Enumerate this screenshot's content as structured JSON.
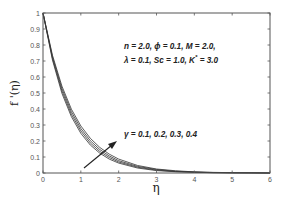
{
  "chart_data": {
    "type": "line",
    "title": "",
    "xlabel": "η",
    "ylabel": "f '(η)",
    "xlim": [
      0,
      6
    ],
    "ylim": [
      0,
      1
    ],
    "xticks": [
      0,
      1,
      2,
      3,
      4,
      5,
      6
    ],
    "yticks": [
      0,
      0.1,
      0.2,
      0.3,
      0.4,
      0.5,
      0.6,
      0.7,
      0.8,
      0.9,
      1
    ],
    "grid": false,
    "x": [
      0,
      0.25,
      0.5,
      0.75,
      1,
      1.25,
      1.5,
      1.75,
      2,
      2.5,
      3,
      3.5,
      4,
      4.5,
      5,
      5.5,
      6
    ],
    "series": [
      {
        "name": "γ = 0.1",
        "values": [
          1,
          0.706,
          0.498,
          0.352,
          0.248,
          0.175,
          0.124,
          0.087,
          0.062,
          0.031,
          0.015,
          0.008,
          0.004,
          0.002,
          0.001,
          0.001,
          0.0
        ]
      },
      {
        "name": "γ = 0.2",
        "values": [
          1,
          0.716,
          0.513,
          0.367,
          0.263,
          0.188,
          0.135,
          0.097,
          0.069,
          0.036,
          0.018,
          0.009,
          0.005,
          0.002,
          0.001,
          0.001,
          0.0
        ]
      },
      {
        "name": "γ = 0.3",
        "values": [
          1,
          0.726,
          0.528,
          0.383,
          0.278,
          0.202,
          0.147,
          0.107,
          0.077,
          0.041,
          0.022,
          0.011,
          0.006,
          0.003,
          0.002,
          0.001,
          0.0
        ]
      },
      {
        "name": "γ = 0.4",
        "values": [
          1,
          0.736,
          0.543,
          0.399,
          0.294,
          0.217,
          0.16,
          0.118,
          0.087,
          0.047,
          0.025,
          0.014,
          0.007,
          0.004,
          0.002,
          0.001,
          0.0
        ]
      }
    ],
    "annotations": [
      {
        "text": "n = 2.0,  ϕ = 0.1,  M = 2.0,",
        "x": 2.2,
        "y": 0.8
      },
      {
        "text": "λ = 0.1,  Sc = 1.0,  K* = 3.0",
        "x": 2.2,
        "y": 0.72
      },
      {
        "text": "γ = 0.1, 0.2, 0.3, 0.4",
        "x": 2.1,
        "y": 0.23
      },
      {
        "text": "arrow",
        "from": [
          1.1,
          0.06
        ],
        "to": [
          1.9,
          0.2
        ]
      }
    ],
    "colors": {
      "line": "#333333",
      "axis": "#555555",
      "text": "#222222"
    }
  },
  "labels": {
    "xlabel": "η",
    "ylabel_main": "f",
    "ylabel_rest": " '(η)",
    "param_line1": "n = 2.0,  ϕ = 0.1,  M = 2.0,",
    "param_line2_a": "λ = 0.1,  Sc = 1.0,  K",
    "param_line2_sup": "*",
    "param_line2_b": " = 3.0",
    "gamma_label": "γ = 0.1, 0.2, 0.3, 0.4"
  }
}
